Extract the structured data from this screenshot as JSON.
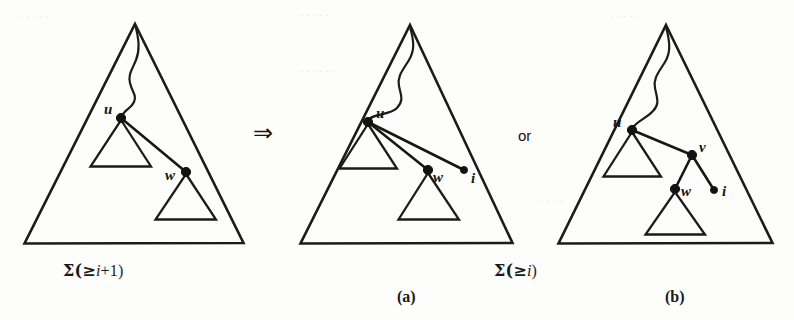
{
  "figure": {
    "background_color": "#fdfdfc",
    "ink_color": "#1b1b1b",
    "panels": [
      {
        "id": "left",
        "caption": "Σ(≥ i+1)",
        "caption_sigma": "Σ(≥",
        "caption_var": "i",
        "caption_tail": "+1)",
        "sublabel": "",
        "nodes": [
          {
            "name": "u",
            "label": "u",
            "x": 121,
            "y": 118,
            "r": 4.6
          },
          {
            "name": "w",
            "label": "w",
            "x": 186,
            "y": 172,
            "r": 4.6
          }
        ],
        "edges": [
          {
            "from": "u",
            "to": "w"
          }
        ]
      },
      {
        "id": "middle",
        "caption": "Σ(≥ i)",
        "caption_sigma": "Σ(≥",
        "caption_var": "i",
        "caption_tail": ")",
        "sublabel": "(a)",
        "nodes": [
          {
            "name": "u",
            "label": "u",
            "x": 368,
            "y": 122,
            "r": 4.6
          },
          {
            "name": "w",
            "label": "w",
            "x": 428,
            "y": 170,
            "r": 4.6
          },
          {
            "name": "i",
            "label": "i",
            "x": 464,
            "y": 170,
            "r": 3.6
          }
        ],
        "edges": [
          {
            "from": "u",
            "to": "w"
          },
          {
            "from": "u",
            "to": "i"
          }
        ]
      },
      {
        "id": "right",
        "caption": "",
        "sublabel": "(b)",
        "nodes": [
          {
            "name": "u",
            "label": "u",
            "x": 632,
            "y": 130,
            "r": 4.6
          },
          {
            "name": "v",
            "label": "v",
            "x": 692,
            "y": 155,
            "r": 4.6
          },
          {
            "name": "w",
            "label": "w",
            "x": 675,
            "y": 189,
            "r": 4.6
          },
          {
            "name": "i",
            "label": "i",
            "x": 714,
            "y": 190,
            "r": 3.6
          }
        ],
        "edges": [
          {
            "from": "u",
            "to": "v"
          },
          {
            "from": "v",
            "to": "w"
          },
          {
            "from": "v",
            "to": "i"
          }
        ]
      }
    ],
    "connectors": {
      "implies": "⇒",
      "or": "or"
    },
    "labels": {
      "u": "u",
      "v": "v",
      "w": "w",
      "i": "i",
      "panel_a": "(a)",
      "panel_b": "(b)"
    }
  }
}
